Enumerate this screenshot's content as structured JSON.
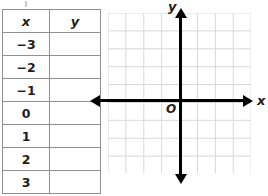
{
  "worksheet": {
    "table": {
      "name": "xy-value-table",
      "headers": [
        "x",
        "y"
      ],
      "rows": [
        {
          "x": "−3",
          "y": ""
        },
        {
          "x": "−2",
          "y": ""
        },
        {
          "x": "−1",
          "y": ""
        },
        {
          "x": "0",
          "y": ""
        },
        {
          "x": "1",
          "y": ""
        },
        {
          "x": "2",
          "y": ""
        },
        {
          "x": "3",
          "y": ""
        }
      ],
      "border_color": "#8e9093",
      "text_color": "#1d1d1d"
    },
    "coordinate_plane": {
      "x_axis_label": "x",
      "y_axis_label": "y",
      "origin_label": "O",
      "grid": {
        "visible": true,
        "line_color": "#d8d8da",
        "cell_size_px": 18,
        "columns": 8,
        "rows": 9
      },
      "axis_color": "#000000",
      "x_axis_arrows": [
        "left",
        "right"
      ],
      "y_axis_arrows": [
        "up",
        "down"
      ],
      "ticks_labeled": false
    }
  }
}
